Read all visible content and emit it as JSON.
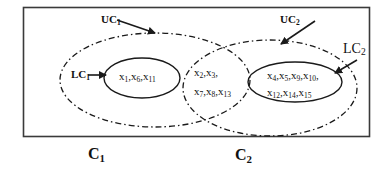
{
  "diagram": {
    "type": "rough-set clustering diagram",
    "clusters": [
      {
        "name": "C",
        "index": "1",
        "upper_approx_label": {
          "base": "UC",
          "sub": "1"
        },
        "lower_approx_label": {
          "base": "LC",
          "sub": "1"
        },
        "lower_approx_members": [
          {
            "base": "x",
            "sub": "1"
          },
          {
            "base": "x",
            "sub": "6"
          },
          {
            "base": "x",
            "sub": "11"
          }
        ]
      },
      {
        "name": "C",
        "index": "2",
        "upper_approx_label": {
          "base": "UC",
          "sub": "2"
        },
        "lower_approx_label": {
          "base": "LC",
          "sub": "2"
        },
        "lower_approx_members_line1": [
          {
            "base": "x",
            "sub": "4"
          },
          {
            "base": "x",
            "sub": "5"
          },
          {
            "base": "x",
            "sub": "9"
          },
          {
            "base": "x",
            "sub": "10"
          }
        ],
        "lower_approx_members_line2": [
          {
            "base": "x",
            "sub": "12"
          },
          {
            "base": "x",
            "sub": "14"
          },
          {
            "base": "x",
            "sub": "15"
          }
        ]
      }
    ],
    "boundary_region_members_line1": [
      {
        "base": "x",
        "sub": "2"
      },
      {
        "base": "x",
        "sub": "3"
      }
    ],
    "boundary_region_members_line2": [
      {
        "base": "x",
        "sub": "7"
      },
      {
        "base": "x",
        "sub": "8"
      },
      {
        "base": "x",
        "sub": "13"
      }
    ],
    "colors": {
      "stroke": "#1a1a1a",
      "background": "#ffffff"
    }
  }
}
